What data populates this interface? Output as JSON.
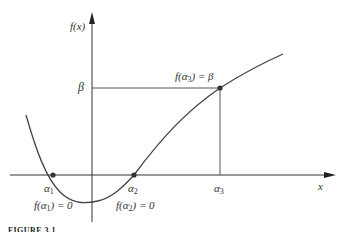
{
  "figure": {
    "y_axis_label": "f(x)",
    "x_axis_label": "x",
    "beta_label": "β",
    "alpha1_label": "α",
    "alpha1_sub": "1",
    "alpha2_label": "α",
    "alpha2_sub": "2",
    "alpha3_label": "α",
    "alpha3_sub": "3",
    "root1_annotation_pre": "f(α",
    "root1_annotation_sub": "1",
    "root1_annotation_post": ") = 0",
    "root2_annotation_pre": "f(α",
    "root2_annotation_sub": "2",
    "root2_annotation_post": ") = 0",
    "point3_annotation_pre": "f(α",
    "point3_annotation_sub": "3",
    "point3_annotation_post": ") = β",
    "caption": "FIGURE 3.1",
    "curve_color": "#444444",
    "axis_color": "#333333"
  }
}
